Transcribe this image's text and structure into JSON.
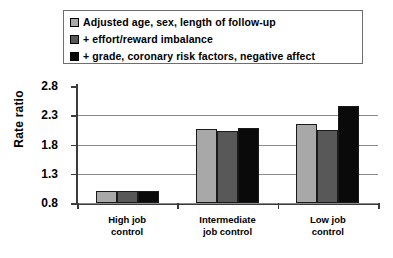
{
  "chart_data": {
    "type": "bar",
    "title": "",
    "xlabel": "",
    "ylabel": "Rate ratio",
    "ylim": [
      0.8,
      2.8
    ],
    "yticks": [
      "0.8",
      "1.3",
      "1.8",
      "2.3",
      "2.8"
    ],
    "grid": true,
    "legend_position": "top",
    "categories": [
      "High job\ncontrol",
      "Intermediate\njob control",
      "Low job\ncontrol"
    ],
    "series": [
      {
        "name": "Adjusted age, sex, length of follow-up",
        "color": "#a8a8a8",
        "values": [
          1.0,
          2.07,
          2.15
        ]
      },
      {
        "name": "+ effort/reward imbalance",
        "color": "#585858",
        "values": [
          1.0,
          2.03,
          2.05
        ]
      },
      {
        "name": "+ grade, coronary risk factors, negative affect",
        "color": "#0a0a0a",
        "values": [
          1.0,
          2.08,
          2.45
        ]
      }
    ]
  },
  "colors": {
    "axis": "#3b3b3b",
    "gridline": "#8a8a8a",
    "legend_border": "#6e6e6e",
    "bar_outline": "#1a1a1a",
    "background": "#ffffff"
  }
}
